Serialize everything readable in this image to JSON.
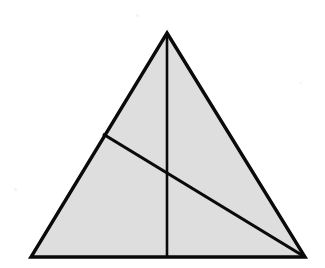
{
  "figure": {
    "kind": "geometry-diagram",
    "canvas": {
      "width": 325,
      "height": 268,
      "background": "#ffffff"
    },
    "style": {
      "fill_color": "#dedede",
      "stroke_color": "#0a0a0a",
      "outline_width": 3.4,
      "median_width": 2.6,
      "cevian_width": 3.2
    },
    "vertices": {
      "apex": {
        "label": "apex",
        "x": 167,
        "y": 33
      },
      "bottom_left": {
        "label": "bottom-left",
        "x": 31,
        "y": 257
      },
      "bottom_right": {
        "label": "bottom-right",
        "x": 305,
        "y": 257
      }
    },
    "points": {
      "base_midpoint": {
        "label": "base-midpoint",
        "x": 167,
        "y": 257
      },
      "left_edge_point": {
        "label": "left-edge-point",
        "x": 103,
        "y": 134
      },
      "intersection": {
        "label": "median-cevian-intersection",
        "x": 167,
        "y": 174
      }
    },
    "outline_path": "M 167 33 L 305 257 L 31 257 Z",
    "median_path": "M 167 33 L 167 257",
    "cevian_path": "M 103 134 L 305 257",
    "segments": [
      {
        "name": "left-side",
        "from": "apex",
        "to": "bottom_left"
      },
      {
        "name": "right-side",
        "from": "apex",
        "to": "bottom_right"
      },
      {
        "name": "base",
        "from": "bottom_left",
        "to": "bottom_right"
      },
      {
        "name": "median",
        "from": "apex",
        "to": "base_midpoint"
      },
      {
        "name": "cevian",
        "from": "left_edge_point",
        "to": "bottom_right"
      }
    ],
    "specks": [
      {
        "x": 136,
        "y": 14,
        "size": 3
      },
      {
        "x": 167,
        "y": 28,
        "size": 2
      },
      {
        "x": 14,
        "y": 188,
        "size": 3
      },
      {
        "x": 300,
        "y": 82,
        "size": 2
      }
    ]
  }
}
